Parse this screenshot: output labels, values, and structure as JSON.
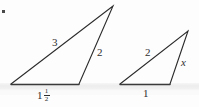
{
  "figure": {
    "caption_mark": "·",
    "background_color": "#fdfdfd",
    "stroke_color": "#2b2b2b"
  },
  "triangles": [
    {
      "id": "large-triangle",
      "vertices": {
        "apex": [
          113,
          6
        ],
        "bottom_left": [
          11,
          84
        ],
        "bottom_right": [
          79,
          84
        ]
      },
      "labels": {
        "hypotenuse": "3",
        "right_side": "2",
        "base_whole": "1",
        "base_fraction_numerator": "1",
        "base_fraction_denominator": "2",
        "base_full": "1 1/2"
      }
    },
    {
      "id": "small-triangle",
      "vertices": {
        "apex": [
          188,
          31
        ],
        "bottom_left": [
          120,
          84
        ],
        "bottom_right": [
          170,
          84
        ]
      },
      "labels": {
        "hypotenuse": "2",
        "right_side": "x",
        "base": "1"
      }
    }
  ]
}
